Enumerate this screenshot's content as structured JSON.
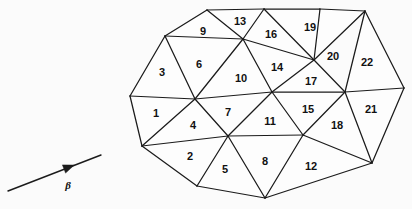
{
  "figure": {
    "background_color": "#fbfbfb",
    "line_color": "#1b1b1b",
    "label_color": "#111111"
  },
  "flow_indicator": {
    "label": "β",
    "name": "beta",
    "line": {
      "x1": 8,
      "y1": 191,
      "x2": 101,
      "y2": 155
    },
    "arrow_head": {
      "x": 64,
      "y": 169,
      "angle_deg": -21
    },
    "label_pos": {
      "x": 68,
      "y": 186
    }
  },
  "mesh": {
    "vertices": {
      "b1": {
        "x": 130,
        "y": 96
      },
      "b2": {
        "x": 165,
        "y": 36
      },
      "b3": {
        "x": 207,
        "y": 10
      },
      "b4": {
        "x": 264,
        "y": 9
      },
      "b5": {
        "x": 320,
        "y": 9
      },
      "b6": {
        "x": 365,
        "y": 11
      },
      "b7": {
        "x": 404,
        "y": 88
      },
      "b8": {
        "x": 372,
        "y": 163
      },
      "b9": {
        "x": 265,
        "y": 198
      },
      "b10": {
        "x": 197,
        "y": 186
      },
      "b11": {
        "x": 142,
        "y": 146
      },
      "i1": {
        "x": 195,
        "y": 99
      },
      "i2": {
        "x": 228,
        "y": 136
      },
      "i3": {
        "x": 243,
        "y": 39
      },
      "i4": {
        "x": 272,
        "y": 92
      },
      "i5": {
        "x": 314,
        "y": 60
      },
      "i6": {
        "x": 345,
        "y": 92
      },
      "i7": {
        "x": 303,
        "y": 135
      }
    },
    "edges": [
      [
        "b1",
        "b2"
      ],
      [
        "b2",
        "b3"
      ],
      [
        "b3",
        "b4"
      ],
      [
        "b4",
        "b5"
      ],
      [
        "b5",
        "b6"
      ],
      [
        "b6",
        "b7"
      ],
      [
        "b7",
        "b8"
      ],
      [
        "b8",
        "b9"
      ],
      [
        "b9",
        "b10"
      ],
      [
        "b10",
        "b11"
      ],
      [
        "b11",
        "b1"
      ],
      [
        "b1",
        "i1"
      ],
      [
        "b2",
        "i1"
      ],
      [
        "b2",
        "i3"
      ],
      [
        "b3",
        "i3"
      ],
      [
        "b4",
        "i3"
      ],
      [
        "b4",
        "i5"
      ],
      [
        "b5",
        "i5"
      ],
      [
        "b6",
        "i5"
      ],
      [
        "b6",
        "i6"
      ],
      [
        "b7",
        "i6"
      ],
      [
        "b8",
        "i6"
      ],
      [
        "b8",
        "i7"
      ],
      [
        "b9",
        "i7"
      ],
      [
        "b9",
        "i2"
      ],
      [
        "b10",
        "i2"
      ],
      [
        "b11",
        "i2"
      ],
      [
        "b11",
        "i1"
      ],
      [
        "i1",
        "i2"
      ],
      [
        "i1",
        "i3"
      ],
      [
        "i1",
        "i4"
      ],
      [
        "i2",
        "i4"
      ],
      [
        "i2",
        "i7"
      ],
      [
        "i3",
        "i4"
      ],
      [
        "i3",
        "i5"
      ],
      [
        "i4",
        "i5"
      ],
      [
        "i4",
        "i6"
      ],
      [
        "i4",
        "i7"
      ],
      [
        "i5",
        "i6"
      ],
      [
        "i6",
        "i7"
      ]
    ],
    "faces": [
      {
        "id": 1,
        "label": "1",
        "verts": [
          "b1",
          "i1",
          "b11"
        ],
        "label_pos": {
          "x": 156,
          "y": 114
        }
      },
      {
        "id": 2,
        "label": "2",
        "verts": [
          "b11",
          "i2",
          "b10"
        ],
        "label_pos": {
          "x": 190,
          "y": 157
        }
      },
      {
        "id": 3,
        "label": "3",
        "verts": [
          "b1",
          "b2",
          "i1"
        ],
        "label_pos": {
          "x": 162,
          "y": 73
        }
      },
      {
        "id": 4,
        "label": "4",
        "verts": [
          "b11",
          "i1",
          "i2"
        ],
        "label_pos": {
          "x": 193,
          "y": 126
        }
      },
      {
        "id": 5,
        "label": "5",
        "verts": [
          "b10",
          "i2",
          "b9"
        ],
        "label_pos": {
          "x": 225,
          "y": 170
        }
      },
      {
        "id": 6,
        "label": "6",
        "verts": [
          "b2",
          "i3",
          "i1"
        ],
        "label_pos": {
          "x": 199,
          "y": 65
        }
      },
      {
        "id": 7,
        "label": "7",
        "verts": [
          "i1",
          "i4",
          "i2"
        ],
        "label_pos": {
          "x": 228,
          "y": 113
        }
      },
      {
        "id": 8,
        "label": "8",
        "verts": [
          "i2",
          "i7",
          "b9"
        ],
        "label_pos": {
          "x": 265,
          "y": 162
        }
      },
      {
        "id": 9,
        "label": "9",
        "verts": [
          "b2",
          "b3",
          "i3"
        ],
        "label_pos": {
          "x": 203,
          "y": 32
        }
      },
      {
        "id": 10,
        "label": "10",
        "verts": [
          "i1",
          "i3",
          "i4"
        ],
        "label_pos": {
          "x": 241,
          "y": 79
        }
      },
      {
        "id": 11,
        "label": "11",
        "verts": [
          "i2",
          "i4",
          "i7"
        ],
        "label_pos": {
          "x": 270,
          "y": 122
        }
      },
      {
        "id": 12,
        "label": "12",
        "verts": [
          "b9",
          "i7",
          "b8"
        ],
        "label_pos": {
          "x": 311,
          "y": 167
        }
      },
      {
        "id": 13,
        "label": "13",
        "verts": [
          "b3",
          "b4",
          "i3"
        ],
        "label_pos": {
          "x": 240,
          "y": 22
        }
      },
      {
        "id": 14,
        "label": "14",
        "verts": [
          "i3",
          "i5",
          "i4"
        ],
        "label_pos": {
          "x": 277,
          "y": 68
        }
      },
      {
        "id": 15,
        "label": "15",
        "verts": [
          "i4",
          "i6",
          "i7"
        ],
        "label_pos": {
          "x": 308,
          "y": 110
        }
      },
      {
        "id": 16,
        "label": "16",
        "verts": [
          "b4",
          "i5",
          "i3"
        ],
        "label_pos": {
          "x": 271,
          "y": 35
        }
      },
      {
        "id": 17,
        "label": "17",
        "verts": [
          "i4",
          "i5",
          "i6"
        ],
        "label_pos": {
          "x": 311,
          "y": 82
        }
      },
      {
        "id": 18,
        "label": "18",
        "verts": [
          "i7",
          "i6",
          "b8"
        ],
        "label_pos": {
          "x": 337,
          "y": 126
        }
      },
      {
        "id": 19,
        "label": "19",
        "verts": [
          "b4",
          "b5",
          "i5"
        ],
        "label_pos": {
          "x": 310,
          "y": 28
        }
      },
      {
        "id": 20,
        "label": "20",
        "verts": [
          "b5",
          "b6",
          "i5"
        ],
        "label_pos": {
          "x": 333,
          "y": 57
        }
      },
      {
        "id": 21,
        "label": "21",
        "verts": [
          "i6",
          "b7",
          "b8"
        ],
        "label_pos": {
          "x": 371,
          "y": 110
        }
      },
      {
        "id": 22,
        "label": "22",
        "verts": [
          "b6",
          "b7",
          "i6"
        ],
        "label_pos": {
          "x": 367,
          "y": 63
        }
      }
    ]
  }
}
